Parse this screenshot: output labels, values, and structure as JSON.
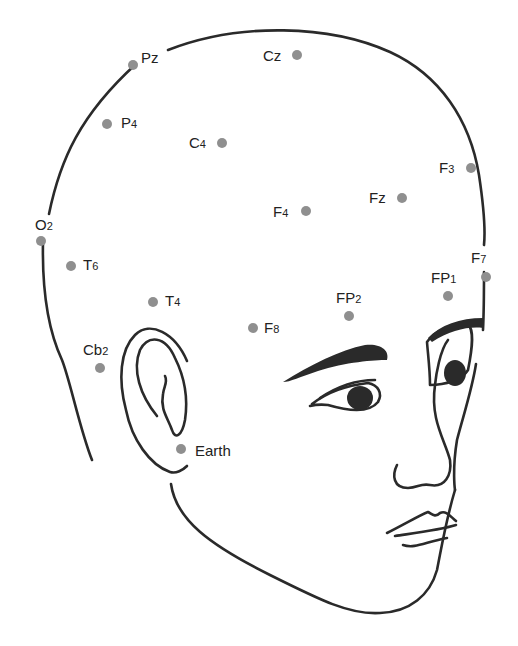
{
  "diagram": {
    "type": "EEG electrode placement on head (right side view)",
    "colors": {
      "line": "#2a2a2a",
      "electrode": "#8f8f8f",
      "text": "#222222",
      "background": "#ffffff"
    },
    "electrodes": [
      {
        "id": "Pz",
        "base": "Pz",
        "sub": "",
        "x": 133,
        "y": 65,
        "lx": 141,
        "ly": 50
      },
      {
        "id": "Cz",
        "base": "Cz",
        "sub": "",
        "x": 297,
        "y": 55,
        "lx": 263,
        "ly": 48
      },
      {
        "id": "P4",
        "base": "P",
        "sub": "4",
        "x": 107,
        "y": 124,
        "lx": 121,
        "ly": 115
      },
      {
        "id": "C4",
        "base": "C",
        "sub": "4",
        "x": 222,
        "y": 143,
        "lx": 189,
        "ly": 135
      },
      {
        "id": "F3",
        "base": "F",
        "sub": "3",
        "x": 471,
        "y": 168,
        "lx": 439,
        "ly": 160
      },
      {
        "id": "Fz",
        "base": "Fz",
        "sub": "",
        "x": 402,
        "y": 198,
        "lx": 369,
        "ly": 190
      },
      {
        "id": "F4",
        "base": "F",
        "sub": "4",
        "x": 306,
        "y": 211,
        "lx": 273,
        "ly": 204
      },
      {
        "id": "O2",
        "base": "O",
        "sub": "2",
        "x": 41,
        "y": 241,
        "lx": 35,
        "ly": 217
      },
      {
        "id": "T6",
        "base": "T",
        "sub": "6",
        "x": 71,
        "y": 266,
        "lx": 83,
        "ly": 257
      },
      {
        "id": "F7",
        "base": "F",
        "sub": "7",
        "x": 486,
        "y": 277,
        "lx": 471,
        "ly": 250
      },
      {
        "id": "FP1",
        "base": "FP",
        "sub": "1",
        "x": 448,
        "y": 296,
        "lx": 431,
        "ly": 270
      },
      {
        "id": "T4",
        "base": "T",
        "sub": "4",
        "x": 153,
        "y": 302,
        "lx": 165,
        "ly": 293
      },
      {
        "id": "FP2",
        "base": "FP",
        "sub": "2",
        "x": 349,
        "y": 316,
        "lx": 336,
        "ly": 290
      },
      {
        "id": "F8",
        "base": "F",
        "sub": "8",
        "x": 253,
        "y": 328,
        "lx": 264,
        "ly": 320
      },
      {
        "id": "Cb2",
        "base": "Cb",
        "sub": "2",
        "x": 100,
        "y": 368,
        "lx": 83,
        "ly": 342
      },
      {
        "id": "Earth",
        "base": "Earth",
        "sub": "",
        "x": 181,
        "y": 449,
        "lx": 195,
        "ly": 443
      }
    ]
  }
}
